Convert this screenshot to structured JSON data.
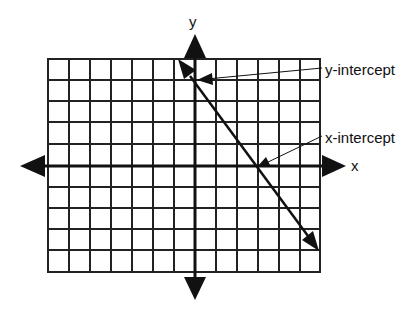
{
  "diagram": {
    "title": "",
    "axes": {
      "x_label": "x",
      "y_label": "y"
    },
    "grid": {
      "columns": 13,
      "rows": 10,
      "columns_left_of_y_axis": 7,
      "rows_above_x_axis": 5
    },
    "line": {
      "description": "line with negative slope",
      "y_intercept_grid_units": 4,
      "x_intercept_grid_units": 3
    },
    "annotations": [
      {
        "id": "y-intercept",
        "text": "y-intercept"
      },
      {
        "id": "x-intercept",
        "text": "x-intercept"
      }
    ],
    "colors": {
      "stroke": "#111111",
      "background": "#ffffff"
    }
  }
}
